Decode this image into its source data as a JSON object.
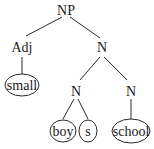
{
  "diagram": {
    "type": "parse-tree",
    "nodes": {
      "root": {
        "label": "NP"
      },
      "adj": {
        "label": "Adj"
      },
      "n_top": {
        "label": "N"
      },
      "small": {
        "label": "small"
      },
      "n_left": {
        "label": "N"
      },
      "n_right": {
        "label": "N"
      },
      "boy": {
        "label": "boy"
      },
      "s": {
        "label": "s"
      },
      "school": {
        "label": "school"
      }
    },
    "edges": [
      [
        "NP",
        "Adj"
      ],
      [
        "NP",
        "N"
      ],
      [
        "Adj",
        "small"
      ],
      [
        "N",
        "N"
      ],
      [
        "N",
        "N"
      ],
      [
        "N",
        "boy"
      ],
      [
        "N",
        "s"
      ],
      [
        "N",
        "school"
      ]
    ]
  }
}
